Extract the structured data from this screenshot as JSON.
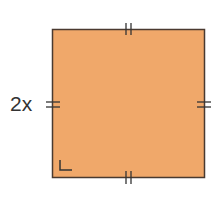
{
  "figure": {
    "shape": "square",
    "fill_color": "#f0a86a",
    "stroke_color": "#4a3a30",
    "side_label": "2x",
    "tick_marks": "double tick marks on all four sides indicating equal sides",
    "right_angle_marker": "bottom-left corner"
  }
}
